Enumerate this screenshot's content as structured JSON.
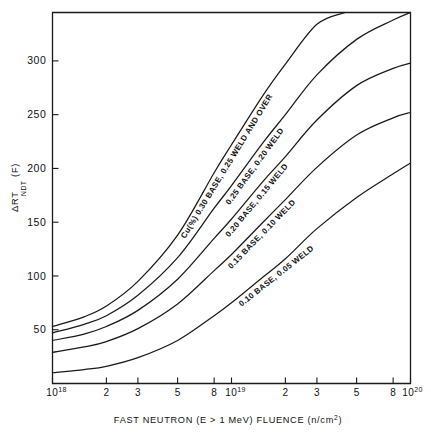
{
  "chart_data": {
    "type": "line",
    "title": "",
    "xlabel": "FAST NEUTRON (E > 1 MeV) FLUENCE (n/cm²)",
    "ylabel": "ΔRT NDT (F)",
    "ylabel_main": "ΔRT",
    "ylabel_sub": "NDT",
    "ylabel_unit": "(F)",
    "xscale": "log",
    "xlim": [
      1e+18,
      1e+20
    ],
    "ylim": [
      0,
      345
    ],
    "grid": false,
    "legend_position": "inline-curve-labels",
    "xticks": [
      {
        "value": 1e+18,
        "label": "10",
        "exponent": "18"
      },
      {
        "value": 2e+18,
        "label": "2",
        "exponent": ""
      },
      {
        "value": 3e+18,
        "label": "3",
        "exponent": ""
      },
      {
        "value": 5e+18,
        "label": "5",
        "exponent": ""
      },
      {
        "value": 8e+18,
        "label": "8",
        "exponent": ""
      },
      {
        "value": 1e+19,
        "label": "10",
        "exponent": "19"
      },
      {
        "value": 2e+19,
        "label": "2",
        "exponent": ""
      },
      {
        "value": 3e+19,
        "label": "3",
        "exponent": ""
      },
      {
        "value": 5e+19,
        "label": "5",
        "exponent": ""
      },
      {
        "value": 8e+19,
        "label": "8",
        "exponent": ""
      },
      {
        "value": 1e+20,
        "label": "10",
        "exponent": "20"
      }
    ],
    "yticks": [
      {
        "value": 50,
        "label": "50"
      },
      {
        "value": 100,
        "label": "100"
      },
      {
        "value": 150,
        "label": "150"
      },
      {
        "value": 200,
        "label": "200"
      },
      {
        "value": 250,
        "label": "250"
      },
      {
        "value": 300,
        "label": "300"
      }
    ],
    "series": [
      {
        "name": "Cu(%) 0.30 BASE, 0.25 WELD AND OVER",
        "label": "Cu(%) 0.30 BASE, 0.25 WELD AND OVER",
        "color": "#1a1a1a",
        "x": [
          1e+18,
          1.5e+18,
          2e+18,
          3e+18,
          5e+18,
          8e+18,
          1e+19,
          1.5e+19,
          2e+19,
          3e+19,
          4.3e+19
        ],
        "values": [
          53,
          62,
          72,
          95,
          138,
          196,
          222,
          268,
          297,
          334,
          345
        ]
      },
      {
        "name": "0.25 BASE, 0.20 WELD",
        "label": "0.25 BASE, 0.20 WELD",
        "color": "#1a1a1a",
        "x": [
          1e+18,
          1.5e+18,
          2e+18,
          3e+18,
          5e+18,
          8e+18,
          1e+19,
          1.5e+19,
          2e+19,
          3e+19,
          5e+19,
          8e+19,
          1e+20
        ],
        "values": [
          47,
          55,
          63,
          82,
          117,
          163,
          184,
          224,
          250,
          287,
          320,
          338,
          345
        ]
      },
      {
        "name": "0.20 BASE, 0.15 WELD",
        "label": "0.20 BASE, 0.15 WELD",
        "color": "#1a1a1a",
        "x": [
          1e+18,
          1.5e+18,
          2e+18,
          3e+18,
          5e+18,
          8e+18,
          1e+19,
          1.5e+19,
          2e+19,
          3e+19,
          5e+19,
          8e+19,
          1e+20
        ],
        "values": [
          40,
          46,
          53,
          68,
          97,
          135,
          153,
          188,
          211,
          245,
          277,
          293,
          298
        ]
      },
      {
        "name": "0.15 BASE, 0.10 WELD",
        "label": "0.15 BASE, 0.10 WELD",
        "color": "#1a1a1a",
        "x": [
          1e+18,
          1.5e+18,
          2e+18,
          3e+18,
          5e+18,
          8e+18,
          1e+19,
          1.5e+19,
          2e+19,
          3e+19,
          5e+19,
          8e+19,
          1e+20
        ],
        "values": [
          29,
          34,
          39,
          51,
          74,
          105,
          120,
          150,
          171,
          201,
          231,
          247,
          252
        ]
      },
      {
        "name": "0.10 BASE, 0.05 WELD",
        "label": "0.10 BASE, 0.05 WELD",
        "color": "#1a1a1a",
        "x": [
          1e+18,
          1.5e+18,
          2e+18,
          3e+18,
          5e+18,
          8e+18,
          1e+19,
          1.5e+19,
          2e+19,
          3e+19,
          5e+19,
          8e+19,
          1e+20
        ],
        "values": [
          10,
          13,
          16,
          24,
          40,
          63,
          75,
          99,
          116,
          144,
          173,
          195,
          205
        ]
      }
    ]
  },
  "axis": {
    "x_title_parts": {
      "main": "FAST NEUTRON (E > 1 MeV) FLUENCE (n/cm",
      "sup": "2",
      "tail": ")"
    }
  }
}
